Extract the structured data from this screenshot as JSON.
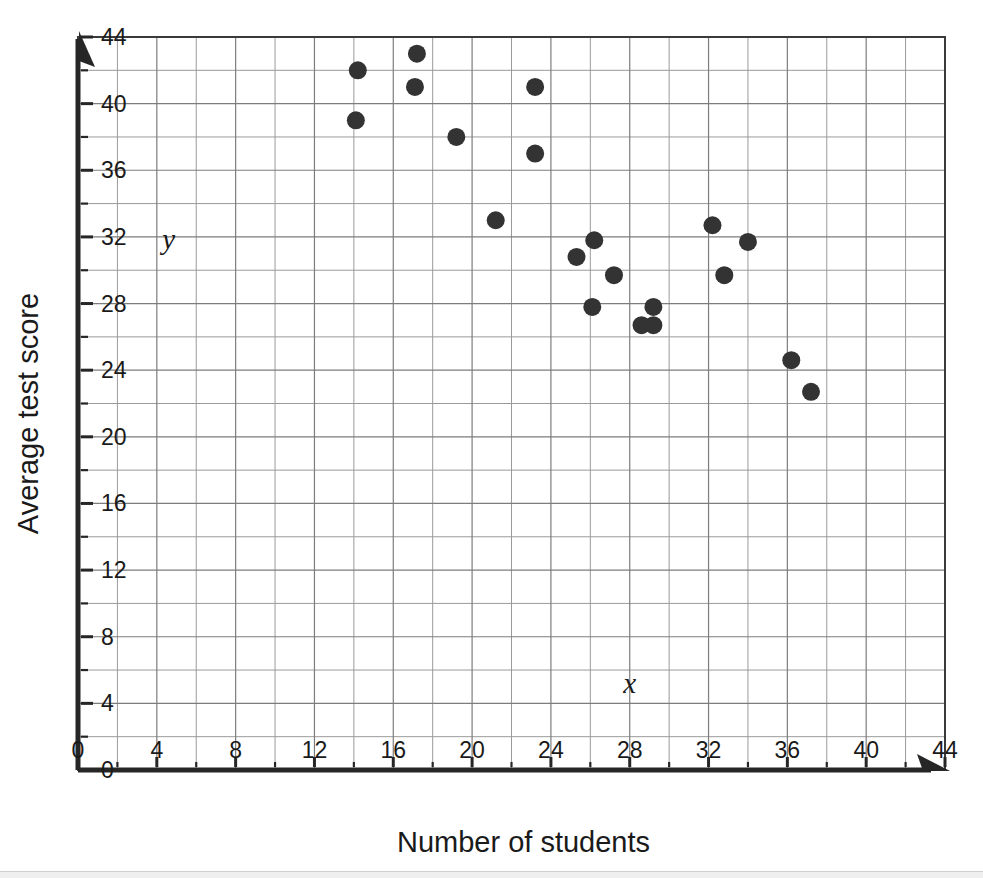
{
  "chart_data": {
    "type": "scatter",
    "title": "",
    "xlabel": "Number of students",
    "ylabel": "Average test score",
    "x_var_label": "x",
    "y_var_label": "y",
    "xlim": [
      0,
      44
    ],
    "ylim": [
      0,
      44
    ],
    "x_tick_step": 4,
    "y_tick_step": 4,
    "x_minor_step": 2,
    "y_minor_step": 2,
    "grid": true,
    "legend": "none",
    "x_tick_labels": [
      "0",
      "4",
      "8",
      "12",
      "16",
      "20",
      "24",
      "28",
      "32",
      "36",
      "40",
      "44"
    ],
    "y_tick_labels": [
      "0",
      "4",
      "8",
      "12",
      "16",
      "20",
      "24",
      "28",
      "32",
      "36",
      "40",
      "44"
    ],
    "x_ticks": [
      0,
      4,
      8,
      12,
      16,
      20,
      24,
      28,
      32,
      36,
      40,
      44
    ],
    "y_ticks": [
      0,
      4,
      8,
      12,
      16,
      20,
      24,
      28,
      32,
      36,
      40,
      44
    ],
    "marker": "filled-circle",
    "marker_color": "#333333",
    "marker_size": 9,
    "points": [
      {
        "x": 14.2,
        "y": 42.0
      },
      {
        "x": 14.1,
        "y": 39.0
      },
      {
        "x": 17.2,
        "y": 43.0
      },
      {
        "x": 17.1,
        "y": 41.0
      },
      {
        "x": 19.2,
        "y": 38.0
      },
      {
        "x": 21.2,
        "y": 33.0
      },
      {
        "x": 23.2,
        "y": 41.0
      },
      {
        "x": 23.2,
        "y": 37.0
      },
      {
        "x": 25.3,
        "y": 30.8
      },
      {
        "x": 26.2,
        "y": 31.8
      },
      {
        "x": 26.1,
        "y": 27.8
      },
      {
        "x": 27.2,
        "y": 29.7
      },
      {
        "x": 28.6,
        "y": 26.7
      },
      {
        "x": 29.2,
        "y": 27.8
      },
      {
        "x": 29.2,
        "y": 26.7
      },
      {
        "x": 32.2,
        "y": 32.7
      },
      {
        "x": 32.8,
        "y": 29.7
      },
      {
        "x": 34.0,
        "y": 31.7
      },
      {
        "x": 36.2,
        "y": 24.6
      },
      {
        "x": 37.2,
        "y": 22.7
      }
    ],
    "x_var_label_pos": {
      "x": 28.0,
      "y": 4.6
    },
    "y_var_label_pos": {
      "x": 4.6,
      "y": 31.3
    }
  },
  "axes": {
    "x_axis_name": "x-axis",
    "y_axis_name": "y-axis",
    "x_arrow": true,
    "y_arrow": true
  }
}
